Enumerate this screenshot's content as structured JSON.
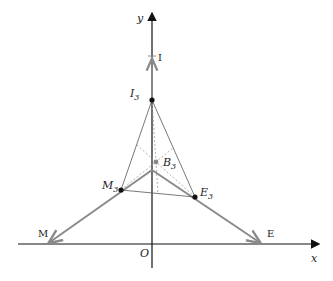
{
  "diagram": {
    "axes": {
      "x_label": "x",
      "y_label": "y",
      "origin_label": "O"
    },
    "points": {
      "I": {
        "label": "I",
        "x": 152,
        "y": 57
      },
      "I3": {
        "label": "I",
        "sub": "3",
        "x": 152,
        "y": 100
      },
      "B3": {
        "label": "B",
        "sub": "3",
        "x": 156,
        "y": 162
      },
      "M3": {
        "label": "M",
        "sub": "3",
        "x": 121,
        "y": 190
      },
      "E3": {
        "label": "E",
        "sub": "3",
        "x": 195,
        "y": 197
      },
      "M": {
        "label": "M",
        "x": 48,
        "y": 244
      },
      "E": {
        "label": "E",
        "x": 261,
        "y": 244
      },
      "V": {
        "x": 152,
        "y": 170
      }
    },
    "colors": {
      "axis": "#111111",
      "thick_line": "#8a8a8a",
      "thin_line": "#555555",
      "dashed": "#9a9a9a"
    }
  }
}
